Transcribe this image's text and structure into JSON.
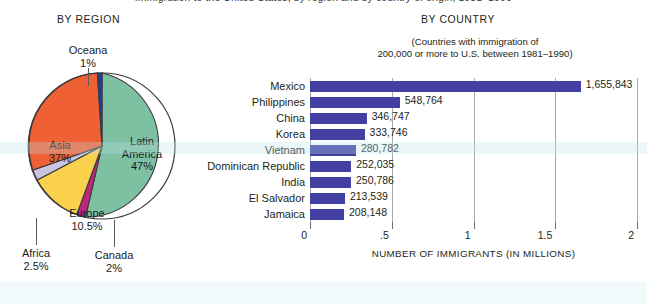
{
  "top_clipped_caption": "immigration to the United States, by region and by country of origin, 1981–1990",
  "pie": {
    "title": "BY REGION",
    "labels": {
      "latin_america": "Latin\nAmerica\n47%",
      "latin_america_name": "Latin",
      "latin_america_name2": "America",
      "latin_america_pct": "47%",
      "asia_name": "Asia",
      "asia_pct": "37%",
      "europe_name": "Europe",
      "europe_pct": "10.5%",
      "africa_name": "Africa",
      "africa_pct": "2.5%",
      "canada_name": "Canada",
      "canada_pct": "2%",
      "oceana_name": "Oceana",
      "oceana_pct": "1%"
    }
  },
  "bar": {
    "title": "BY COUNTRY",
    "subtitle_line1": "(Countries with immigration of",
    "subtitle_line2": "200,000 or more to U.S. between 1981–1990)",
    "axis_title": "NUMBER OF IMMIGRANTS (IN MILLIONS)"
  },
  "chart_data": [
    {
      "type": "pie",
      "title": "BY REGION",
      "categories": [
        "Latin America",
        "Canada",
        "Europe",
        "Africa",
        "Asia",
        "Oceana"
      ],
      "values": [
        47,
        2,
        10.5,
        2.5,
        37,
        1
      ],
      "value_labels": [
        "47%",
        "2%",
        "10.5%",
        "2.5%",
        "37%",
        "1%"
      ],
      "unit": "percent",
      "colors": [
        "#7ec1a2",
        "#c02680",
        "#f9d14c",
        "#c9c5de",
        "#ef6134",
        "#1f3d9e"
      ],
      "legend": "inline-labels",
      "start_angle_deg": 0,
      "direction": "clockwise"
    },
    {
      "type": "bar",
      "orientation": "horizontal",
      "title": "BY COUNTRY",
      "subtitle": "(Countries with immigration of 200,000 or more to U.S. between 1981–1990)",
      "categories": [
        "Mexico",
        "Philippines",
        "China",
        "Korea",
        "Vietnam",
        "Dominican Republic",
        "India",
        "El Salvador",
        "Jamaica"
      ],
      "values": [
        1655843,
        548764,
        346747,
        333746,
        280782,
        252035,
        250786,
        213539,
        208148
      ],
      "value_labels": [
        "1,655,843",
        "548,764",
        "346,747",
        "333,746",
        "280,782",
        "252,035",
        "250,786",
        "213,539",
        "208,148"
      ],
      "xlabel": "NUMBER OF IMMIGRANTS (IN MILLIONS)",
      "ylabel": "",
      "xlim": [
        0,
        2000000
      ],
      "xticks": [
        0,
        500000,
        1000000,
        1500000,
        2000000
      ],
      "xtick_labels": [
        "0",
        ".5",
        "1",
        "1.5",
        "2"
      ],
      "grid": true,
      "bar_color": "#4340a4",
      "legend": "none"
    }
  ]
}
